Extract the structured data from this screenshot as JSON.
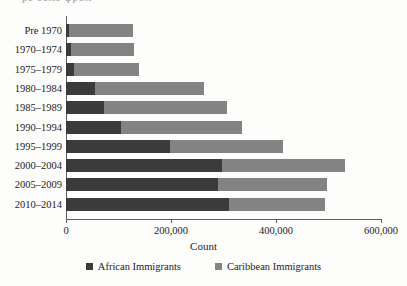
{
  "top_partial_text": "ре соме фром",
  "chart_data": {
    "type": "bar",
    "orientation": "horizontal",
    "stacked": true,
    "title": "",
    "xlabel": "Count",
    "ylabel": "",
    "xlim": [
      0,
      600000
    ],
    "xticks": [
      0,
      200000,
      400000,
      600000
    ],
    "xtick_labels": [
      "0",
      "200,000",
      "400,000",
      "600,000"
    ],
    "grid": false,
    "legend_position": "bottom",
    "categories": [
      "Pre 1970",
      "1970–1974",
      "1975–1979",
      "1980–1984",
      "1985–1989",
      "1990–1994",
      "1995–1999",
      "2000–2004",
      "2005–2009",
      "2010–2014"
    ],
    "series": [
      {
        "name": "African Immigrants",
        "color": "#3b3b3b",
        "values": [
          6000,
          10000,
          15000,
          55000,
          72000,
          105000,
          198000,
          297000,
          290000,
          311000
        ]
      },
      {
        "name": "Caribbean Immigrants",
        "color": "#838383",
        "values": [
          122000,
          120000,
          124000,
          208000,
          235000,
          230000,
          215000,
          234000,
          207000,
          182000
        ]
      }
    ],
    "totals": [
      128000,
      130000,
      139000,
      263000,
      307000,
      335000,
      413000,
      531000,
      497000,
      493000
    ]
  },
  "legend": {
    "items": [
      {
        "label": "African Immigrants",
        "color": "#3b3b3b"
      },
      {
        "label": "Caribbean Immigrants",
        "color": "#838383"
      }
    ]
  }
}
